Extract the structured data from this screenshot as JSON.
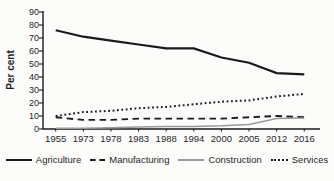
{
  "figure": {
    "background": "#fcfcfb",
    "axis_color": "#1a1a1a",
    "text_color": "#1f1f1f"
  },
  "chart_data": {
    "type": "line",
    "title": "",
    "xlabel": "",
    "ylabel": "Per cent",
    "ylim": [
      0,
      90
    ],
    "y_ticks": [
      0,
      10,
      20,
      30,
      40,
      50,
      60,
      70,
      80,
      90
    ],
    "grid": false,
    "legend_position": "bottom",
    "categories": [
      "1955",
      "1973",
      "1978",
      "1983",
      "1988",
      "1994",
      "2000",
      "2005",
      "2012",
      "2016"
    ],
    "series": [
      {
        "name": "Agriculture",
        "style": "solid",
        "color": "#1a1a1a",
        "width": 2.2,
        "values": [
          76,
          71,
          68,
          65,
          62,
          62,
          55,
          51,
          43,
          42
        ]
      },
      {
        "name": "Manufacturing",
        "style": "dashed",
        "color": "#1a1a1a",
        "width": 1.9,
        "values": [
          9,
          7,
          7,
          8,
          8,
          8,
          8,
          9,
          10,
          9
        ]
      },
      {
        "name": "Construction",
        "style": "solid",
        "color": "#9a9a9a",
        "width": 1.5,
        "values": [
          0.5,
          0.5,
          1,
          1.5,
          2,
          2,
          2.5,
          3.5,
          8,
          8.5
        ]
      },
      {
        "name": "Services",
        "style": "dotted",
        "color": "#1a1a1a",
        "width": 2,
        "values": [
          10,
          13,
          14,
          16,
          17,
          19,
          21,
          22,
          25,
          27
        ]
      }
    ]
  }
}
